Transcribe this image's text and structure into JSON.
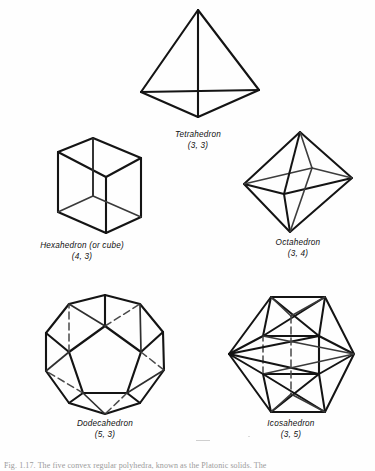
{
  "figure": {
    "solids": [
      {
        "id": "tetrahedron",
        "name": "Tetrahedron",
        "schlafli": "(3, 3)",
        "icon": "tetrahedron-wireframe-icon",
        "faces": 4,
        "face_polygon_sides": 3,
        "vertex_figure": 3
      },
      {
        "id": "hexahedron",
        "name": "Hexahedron (or cube)",
        "schlafli": "(4, 3)",
        "icon": "cube-wireframe-icon",
        "faces": 6,
        "face_polygon_sides": 4,
        "vertex_figure": 3
      },
      {
        "id": "octahedron",
        "name": "Octahedron",
        "schlafli": "(3, 4)",
        "icon": "octahedron-wireframe-icon",
        "faces": 8,
        "face_polygon_sides": 3,
        "vertex_figure": 4
      },
      {
        "id": "dodecahedron",
        "name": "Dodecahedron",
        "schlafli": "(5, 3)",
        "icon": "dodecahedron-wireframe-icon",
        "faces": 12,
        "face_polygon_sides": 5,
        "vertex_figure": 3
      },
      {
        "id": "icosahedron",
        "name": "Icosahedron",
        "schlafli": "(3, 5)",
        "icon": "icosahedron-wireframe-icon",
        "faces": 20,
        "face_polygon_sides": 3,
        "vertex_figure": 5
      }
    ]
  },
  "colors": {
    "ink": "#1a1a1a",
    "paper": "#fefefe",
    "hidden_edge": "#7d7d7d",
    "footnote": "#9b9b9b"
  },
  "footnote": {
    "text": "Fig. 1.17. The five convex regular polyhedra, known as the Platonic solids. The"
  }
}
